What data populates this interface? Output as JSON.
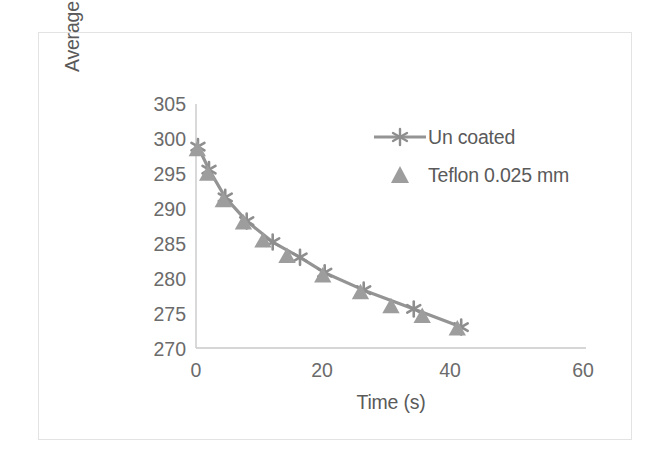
{
  "chart_data": {
    "type": "line",
    "title": "",
    "xlabel": "Time (s)",
    "ylabel": "Average Surface Temperature (K)",
    "ylabel_lines": [
      "Average Surface Temperature",
      "(K)"
    ],
    "xlim": [
      0,
      60
    ],
    "ylim": [
      270,
      305
    ],
    "xticks": [
      0,
      20,
      40,
      60
    ],
    "yticks": [
      270,
      275,
      280,
      285,
      290,
      295,
      300,
      305
    ],
    "xtick_labels": [
      "0",
      "20",
      "40",
      "60"
    ],
    "ytick_labels": [
      "270",
      "275",
      "280",
      "285",
      "290",
      "295",
      "300",
      "305"
    ],
    "grid": false,
    "legend_position": "upper right",
    "series": [
      {
        "name": "Un coated",
        "marker": "asterisk",
        "line": true,
        "color": "#949494",
        "x": [
          0.3,
          2.0,
          4.5,
          7.8,
          11.8,
          16.0,
          19.8,
          25.8,
          33.5,
          40.8
        ],
        "y": [
          298.9,
          295.6,
          291.6,
          288.2,
          285.2,
          283.0,
          280.8,
          278.3,
          275.6,
          273.0
        ]
      },
      {
        "name": "Teflon 0.025 mm",
        "marker": "triangle",
        "line": false,
        "color": "#9d9d9d",
        "x": [
          0.2,
          1.8,
          4.2,
          7.3,
          10.3,
          14.0,
          19.5,
          25.3,
          30.0,
          34.8,
          40.2
        ],
        "y": [
          298.5,
          295.0,
          291.2,
          288.0,
          285.4,
          283.2,
          280.4,
          278.0,
          276.0,
          274.6,
          272.8
        ]
      }
    ]
  },
  "legend": {
    "items": [
      {
        "label": "Un coated",
        "marker": "asterisk-line-marker",
        "color": "#949494"
      },
      {
        "label": "Teflon 0.025 mm",
        "marker": "triangle-marker",
        "color": "#9d9d9d"
      }
    ]
  },
  "colors": {
    "series": "#949494",
    "axis": "#c9c9c9",
    "text": "#5a5a5a",
    "tick_text": "#6b6b6b",
    "frame_border": "#e3e3e3",
    "background": "#ffffff"
  }
}
